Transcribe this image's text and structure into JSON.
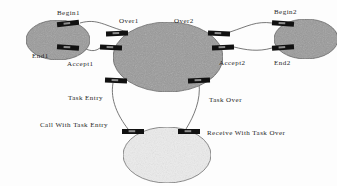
{
  "diagram": {
    "background": "#fdfdfd",
    "colors": {
      "ellipse_dark_fill": "#9a9a9a",
      "ellipse_light_fill": "#ececec",
      "ellipse_stroke": "#4a4a4a",
      "port_fill": "#111111",
      "connector_stroke": "#555555",
      "label_color": "#262626"
    },
    "nodes": [
      {
        "id": "left-component",
        "shape": "ellipse",
        "fill": "ellipse_dark_fill",
        "cx": 58,
        "cy": 40,
        "rx": 32,
        "ry": 20
      },
      {
        "id": "center-component",
        "shape": "ellipse",
        "fill": "ellipse_dark_fill",
        "cx": 168,
        "cy": 57,
        "rx": 55,
        "ry": 35
      },
      {
        "id": "right-component",
        "shape": "ellipse",
        "fill": "ellipse_dark_fill",
        "cx": 306,
        "cy": 39,
        "rx": 32,
        "ry": 20
      },
      {
        "id": "bottom-component",
        "shape": "ellipse",
        "fill": "ellipse_light_fill",
        "cx": 167,
        "cy": 155,
        "rx": 44,
        "ry": 28
      }
    ],
    "ports": [
      {
        "id": "port-begin1",
        "x": 57,
        "y": 21,
        "w": 22,
        "h": 5,
        "angle": -6
      },
      {
        "id": "port-end1",
        "x": 57,
        "y": 45,
        "w": 22,
        "h": 5,
        "angle": 4
      },
      {
        "id": "port-over1",
        "x": 106,
        "y": 31,
        "w": 22,
        "h": 5,
        "angle": -2
      },
      {
        "id": "port-accept1",
        "x": 100,
        "y": 45,
        "w": 22,
        "h": 5,
        "angle": 2
      },
      {
        "id": "port-over2",
        "x": 208,
        "y": 31,
        "w": 22,
        "h": 5,
        "angle": 2
      },
      {
        "id": "port-accept2",
        "x": 212,
        "y": 45,
        "w": 22,
        "h": 5,
        "angle": -2
      },
      {
        "id": "port-begin2",
        "x": 272,
        "y": 21,
        "w": 22,
        "h": 5,
        "angle": 4
      },
      {
        "id": "port-end2",
        "x": 272,
        "y": 45,
        "w": 22,
        "h": 5,
        "angle": -4
      },
      {
        "id": "port-taskentry",
        "x": 105,
        "y": 78,
        "w": 22,
        "h": 5,
        "angle": 2
      },
      {
        "id": "port-taskover",
        "x": 188,
        "y": 78,
        "w": 22,
        "h": 5,
        "angle": -2
      },
      {
        "id": "port-callwithtaskentry",
        "x": 122,
        "y": 129,
        "w": 22,
        "h": 5,
        "angle": 0
      },
      {
        "id": "port-receivewithtaskover",
        "x": 178,
        "y": 129,
        "w": 22,
        "h": 5,
        "angle": 0
      }
    ],
    "connectors": [
      {
        "id": "conn-begin1-over1",
        "path": "M 80 23 C 98 18, 104 26, 128 32"
      },
      {
        "id": "conn-accept1-end1",
        "path": "M 100 48 C 92 54, 86 48, 79 47"
      },
      {
        "id": "conn-over2-begin2",
        "path": "M 230 32 C 248 26, 256 21, 272 23"
      },
      {
        "id": "conn-end2-accept2",
        "path": "M 272 48 C 258 52, 246 50, 234 47"
      },
      {
        "id": "conn-taskentry-call",
        "path": "M 113 83 C 110 100, 118 116, 128 129"
      },
      {
        "id": "conn-taskover-recv",
        "path": "M 199 83 C 201 100, 194 116, 186 129"
      }
    ],
    "labels": [
      {
        "id": "label-begin1",
        "text": "Begin1",
        "x": 57,
        "y": 10
      },
      {
        "id": "label-end1",
        "text": "End1",
        "x": 32,
        "y": 53
      },
      {
        "id": "label-accept1",
        "text": "Accept1",
        "x": 67,
        "y": 61
      },
      {
        "id": "label-over1",
        "text": "Over1",
        "x": 119,
        "y": 18
      },
      {
        "id": "label-over2",
        "text": "Over2",
        "x": 174,
        "y": 18
      },
      {
        "id": "label-accept2",
        "text": "Accept2",
        "x": 219,
        "y": 60
      },
      {
        "id": "label-begin2",
        "text": "Begin2",
        "x": 274,
        "y": 9
      },
      {
        "id": "label-end2",
        "text": "End2",
        "x": 274,
        "y": 60
      },
      {
        "id": "label-task-entry",
        "text": "Task Entry",
        "x": 68,
        "y": 95
      },
      {
        "id": "label-task-over",
        "text": "Task Over",
        "x": 209,
        "y": 97
      },
      {
        "id": "label-call-with-task-entry",
        "text": "Call With Task Entry",
        "x": 40,
        "y": 122
      },
      {
        "id": "label-receive-with-task-over",
        "text": "Receive With Task Over",
        "x": 207,
        "y": 130
      }
    ]
  }
}
